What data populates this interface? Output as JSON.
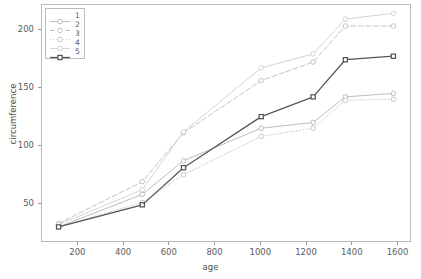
{
  "chart_data": {
    "type": "line",
    "title": "",
    "xlabel": "age",
    "ylabel": "circumference",
    "xlim": [
      41,
      1659
    ],
    "ylim": [
      17,
      222
    ],
    "grid": false,
    "legend_position": "upper left",
    "x": [
      118,
      484,
      664,
      1004,
      1231,
      1372,
      1582
    ],
    "xticks": [
      200,
      400,
      600,
      800,
      1000,
      1200,
      1400,
      1600
    ],
    "yticks": [
      50,
      100,
      150,
      200
    ],
    "series": [
      {
        "name": "1",
        "label": "1",
        "values": [
          30,
          58,
          87,
          115,
          120,
          142,
          145
        ],
        "color": "#b6b6b6",
        "linestyle": "solid",
        "marker": "circle"
      },
      {
        "name": "2",
        "label": "2",
        "values": [
          33,
          69,
          111,
          156,
          172,
          203,
          203
        ],
        "color": "#bcbcbc",
        "linestyle": "dashed",
        "marker": "circle"
      },
      {
        "name": "3",
        "label": "3",
        "values": [
          30,
          51,
          75,
          108,
          115,
          139,
          140
        ],
        "color": "#c2c2c2",
        "linestyle": "dotted",
        "marker": "circle"
      },
      {
        "name": "4",
        "label": "4",
        "values": [
          32,
          62,
          112,
          167,
          179,
          209,
          214
        ],
        "color": "#cfcfcf",
        "linestyle": "solid",
        "marker": "circle"
      },
      {
        "name": "5",
        "label": "5",
        "values": [
          30,
          49,
          81,
          125,
          142,
          174,
          177
        ],
        "color": "#555555",
        "linestyle": "solid",
        "marker": "square"
      }
    ]
  },
  "legend": {
    "entries": [
      {
        "label": "1"
      },
      {
        "label": "2"
      },
      {
        "label": "3"
      },
      {
        "label": "4"
      },
      {
        "label": "5"
      }
    ]
  },
  "axes": {
    "x_title": "age",
    "y_title": "circumference",
    "x_tick_labels": [
      "200",
      "400",
      "600",
      "800",
      "1000",
      "1200",
      "1400",
      "1600"
    ],
    "y_tick_labels": [
      "50",
      "100",
      "150",
      "200"
    ]
  }
}
